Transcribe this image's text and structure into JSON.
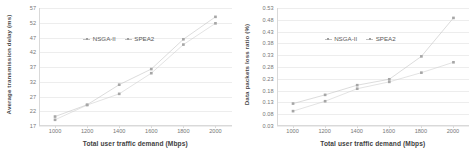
{
  "figure": {
    "panels": [
      "left",
      "right"
    ]
  },
  "legend": {
    "series": [
      {
        "name": "NSGA-II",
        "marker": "plus-marker"
      },
      {
        "name": "SPEA2",
        "marker": "dash-marker"
      }
    ]
  },
  "chart_data": [
    {
      "id": "average-transmission-delay",
      "type": "line",
      "title": "",
      "xlabel": "Total user traffic demand (Mbps)",
      "ylabel": "Average transmission delay (ms)",
      "x": [
        1000,
        1200,
        1400,
        1600,
        1800,
        2000
      ],
      "xticklabels": [
        "1000",
        "1200",
        "1400",
        "1600",
        "1800",
        "2000"
      ],
      "xlim": [
        900,
        2100
      ],
      "ylim": [
        17,
        57
      ],
      "yticks": [
        17,
        22,
        27,
        32,
        37,
        42,
        47,
        52,
        57
      ],
      "yticklabels": [
        "17",
        "22",
        "27",
        "32",
        "37",
        "42",
        "47",
        "52",
        "57"
      ],
      "grid": true,
      "legend_position": "upper-left-inside",
      "series": [
        {
          "name": "NSGA-II",
          "values": [
            20.2,
            24.2,
            31.0,
            36.3,
            46.4,
            54.0
          ],
          "color": "#bfbfbf"
        },
        {
          "name": "SPEA2",
          "values": [
            19.1,
            24.1,
            27.9,
            34.9,
            44.6,
            51.8
          ],
          "color": "#cccccc"
        }
      ]
    },
    {
      "id": "data-packets-loss-ratio",
      "type": "line",
      "title": "",
      "xlabel": "Total user traffic demand (Mbps)",
      "ylabel": "Data packets loss ratio (%)",
      "x": [
        1000,
        1200,
        1400,
        1600,
        1800,
        2000
      ],
      "xticklabels": [
        "1000",
        "1200",
        "1400",
        "1600",
        "1800",
        "2000"
      ],
      "xlim": [
        900,
        2100
      ],
      "ylim": [
        0.03,
        0.53
      ],
      "yticks": [
        0.03,
        0.08,
        0.13,
        0.18,
        0.23,
        0.28,
        0.33,
        0.38,
        0.43,
        0.48,
        0.53
      ],
      "yticklabels": [
        "0.03",
        "0.08",
        "0.13",
        "0.18",
        "0.23",
        "0.28",
        "0.33",
        "0.38",
        "0.43",
        "0.48",
        "0.53"
      ],
      "grid": true,
      "legend_position": "upper-left-inside",
      "series": [
        {
          "name": "NSGA-II",
          "values": [
            0.125,
            0.162,
            0.203,
            0.228,
            0.325,
            0.488
          ],
          "color": "#bfbfbf"
        },
        {
          "name": "SPEA2",
          "values": [
            0.093,
            0.135,
            0.188,
            0.217,
            0.256,
            0.3
          ],
          "color": "#cccccc"
        }
      ]
    }
  ]
}
